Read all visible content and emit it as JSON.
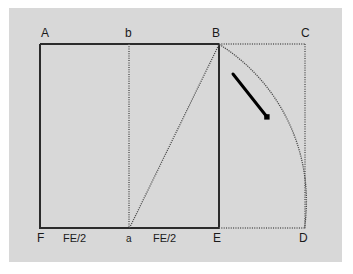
{
  "figure": {
    "background_color": "#d8d8d8",
    "page_color": "#ffffff",
    "stroke_color": "#2b2b2b",
    "dotted_color": "#4d4d4d",
    "pointer_color": "#000000",
    "vertices": [
      {
        "id": "A",
        "label": "A",
        "x": 40,
        "y": 44,
        "label_x": 41,
        "label_y": 28
      },
      {
        "id": "b",
        "label": "b",
        "x": 129,
        "y": 44,
        "label_x": 126,
        "label_y": 28
      },
      {
        "id": "B",
        "label": "B",
        "x": 219,
        "y": 44,
        "label_x": 212,
        "label_y": 28
      },
      {
        "id": "C",
        "label": "C",
        "x": 305,
        "y": 44,
        "label_x": 301,
        "label_y": 28
      },
      {
        "id": "F",
        "label": "F",
        "x": 40,
        "y": 228,
        "label_x": 38,
        "label_y": 232
      },
      {
        "id": "a",
        "label": "a",
        "x": 129,
        "y": 228,
        "label_x": 126,
        "label_y": 233
      },
      {
        "id": "E",
        "label": "E",
        "x": 219,
        "y": 228,
        "label_x": 213,
        "label_y": 232
      },
      {
        "id": "D",
        "label": "D",
        "x": 305,
        "y": 228,
        "label_x": 300,
        "label_y": 232
      }
    ],
    "segment_labels": [
      {
        "id": "fa-half",
        "text": "FE/2",
        "x": 65,
        "y": 233
      },
      {
        "id": "ae-half",
        "text": "FE/2",
        "x": 155,
        "y": 233
      }
    ],
    "solid_edges": [
      {
        "id": "A-B",
        "from": "A",
        "to": "B"
      },
      {
        "id": "A-F",
        "from": "A",
        "to": "F"
      },
      {
        "id": "F-E",
        "from": "F",
        "to": "E"
      },
      {
        "id": "B-E",
        "from": "B",
        "to": "E"
      }
    ],
    "dotted_edges": [
      {
        "id": "B-C",
        "from": "B",
        "to": "C"
      },
      {
        "id": "C-D",
        "from": "C",
        "to": "D"
      },
      {
        "id": "E-D",
        "from": "E",
        "to": "D"
      },
      {
        "id": "b-a",
        "from": "b",
        "to": "a"
      }
    ],
    "dotted_diagonal": {
      "id": "a-B",
      "from": "a",
      "to": "B"
    },
    "arc": {
      "id": "arc-B-D",
      "from": "B",
      "to": "D",
      "center": "E",
      "radius": 186,
      "description": "quarter circle arc from B to D centred at E"
    },
    "pointer": {
      "id": "arc-pointer",
      "x1": 233,
      "y1": 74,
      "x2": 268,
      "y2": 118,
      "width": 3
    }
  }
}
